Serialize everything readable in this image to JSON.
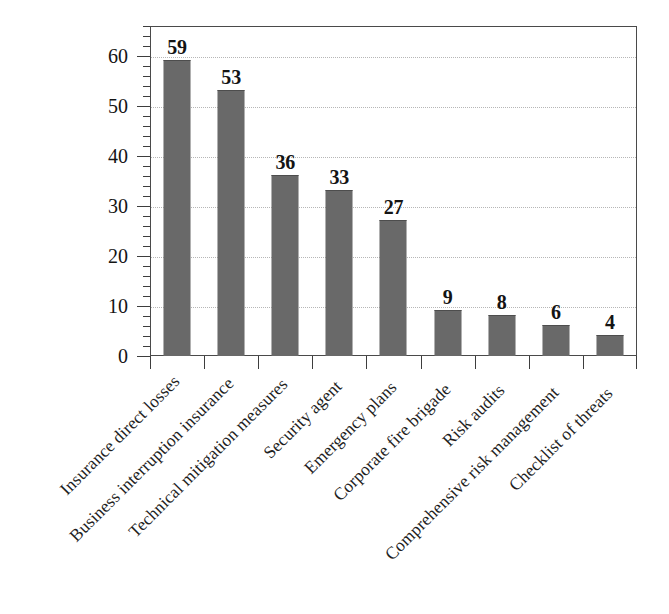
{
  "chart_data": {
    "type": "bar",
    "title": "",
    "subtitle": "",
    "xlabel": "",
    "ylabel": "",
    "ylim": [
      0,
      66
    ],
    "grid": true,
    "legend": false,
    "legend_position": "none",
    "orientation": "vertical",
    "bar_color": "#5c5c5c",
    "categories": [
      "Insurance direct losses",
      "Business interruption insurance",
      "Technical mitigation measures",
      "Security agent",
      "Emergency plans",
      "Corporate fire brigade",
      "Risk audits",
      "Comprehensive risk management",
      "Checklist of threats"
    ],
    "values": [
      59,
      53,
      36,
      33,
      27,
      9,
      8,
      6,
      4
    ],
    "value_labels": [
      "59",
      "53",
      "36",
      "33",
      "27",
      "9",
      "8",
      "6",
      "4"
    ],
    "y_ticks": [
      0,
      10,
      20,
      30,
      40,
      50,
      60
    ],
    "y_tick_labels": [
      "0",
      "10",
      "20",
      "30",
      "40",
      "50",
      "60"
    ],
    "y_minor_tick_step": 2,
    "x_tick_count": 10
  },
  "axes": {
    "y_axis_name": "y-axis",
    "x_axis_name": "x-axis"
  }
}
